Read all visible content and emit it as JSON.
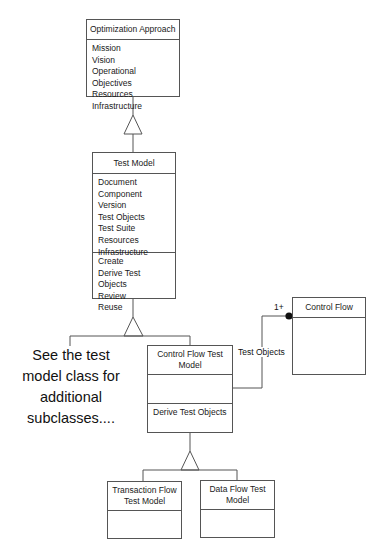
{
  "classes": {
    "optimization_approach": {
      "name": "Optimization Approach",
      "attributes": [
        "Mission",
        "Vision",
        "Operational Objectives",
        "Resources",
        "Infrastructure"
      ]
    },
    "test_model": {
      "name": "Test Model",
      "attributes": [
        "Document",
        "Component",
        "Version",
        "Test Objects",
        "Test Suite",
        "Resources",
        "Infrastructure"
      ],
      "operations": [
        "Create",
        "Derive Test Objects",
        "Review",
        "Reuse"
      ]
    },
    "control_flow_test_model": {
      "name": "Control Flow Test Model",
      "attributes": [],
      "operations": [
        "Derive Test Objects"
      ]
    },
    "control_flow": {
      "name": "Control Flow",
      "attributes": []
    },
    "transaction_flow_test_model": {
      "name": "Transaction Flow Test Model",
      "attributes": []
    },
    "data_flow_test_model": {
      "name": "Data Flow Test Model",
      "attributes": []
    }
  },
  "note": "See the test model class for additional subclasses....",
  "association": {
    "label": "Test Objects",
    "multiplicity": "1+"
  },
  "colors": {
    "line": "#555555",
    "background": "#ffffff",
    "text": "#1a1a1a"
  }
}
